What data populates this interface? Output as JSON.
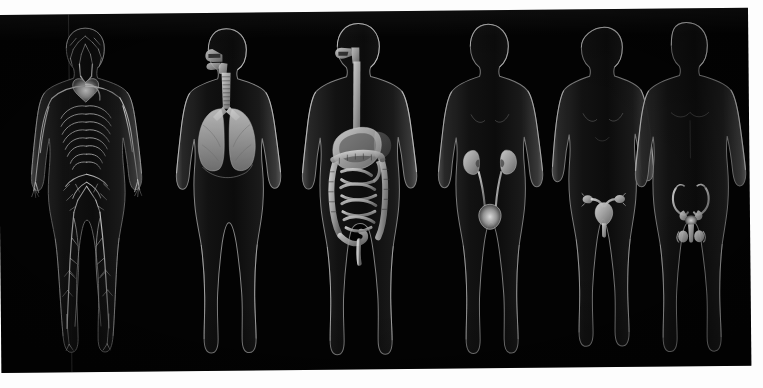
{
  "image": {
    "kind": "anatomical-illustration",
    "title": "Human Organ Systems",
    "background_color": "#030303",
    "border_color": "#ffffff",
    "figure_count": 6,
    "style": "translucent grey silhouettes on black, organs rendered in pale grey highlight"
  },
  "figures": [
    {
      "id": "circulatory",
      "label": "Circulatory System",
      "sex": "male",
      "organs": [
        "heart",
        "aorta",
        "carotid arteries",
        "jugular veins",
        "ribcage vessels",
        "femoral arteries",
        "leg veins",
        "arm arteries"
      ],
      "highlight_color": "#c9c9c9",
      "body_color": "#1a1a1a"
    },
    {
      "id": "respiratory",
      "label": "Respiratory System",
      "sex": "female",
      "organs": [
        "nasal cavity",
        "pharynx",
        "larynx",
        "trachea",
        "bronchi",
        "left lung",
        "right lung",
        "diaphragm"
      ],
      "highlight_color": "#b8b8b8",
      "body_color": "#1a1a1a"
    },
    {
      "id": "digestive",
      "label": "Digestive System",
      "sex": "male",
      "organs": [
        "mouth",
        "esophagus",
        "stomach",
        "liver",
        "small intestine",
        "large intestine",
        "colon",
        "rectum"
      ],
      "highlight_color": "#bfbfbf",
      "body_color": "#1a1a1a"
    },
    {
      "id": "urinary",
      "label": "Urinary System",
      "sex": "female",
      "organs": [
        "left kidney",
        "right kidney",
        "left ureter",
        "right ureter",
        "urinary bladder",
        "urethra"
      ],
      "highlight_color": "#b5b5b5",
      "body_color": "#161616"
    },
    {
      "id": "reproductive-female",
      "label": "Female Reproductive System",
      "sex": "female",
      "organs": [
        "uterus",
        "fallopian tubes",
        "ovaries",
        "cervix",
        "vagina"
      ],
      "highlight_color": "#b0b0b0",
      "body_color": "#161616"
    },
    {
      "id": "reproductive-male",
      "label": "Male Reproductive System",
      "sex": "male",
      "organs": [
        "vas deferens",
        "seminal vesicles",
        "prostate",
        "testes",
        "epididymis",
        "penis"
      ],
      "highlight_color": "#b0b0b0",
      "body_color": "#161616"
    }
  ]
}
